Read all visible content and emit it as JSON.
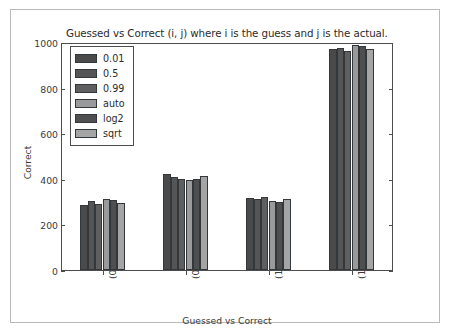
{
  "chart_data": {
    "type": "bar",
    "title": "Guessed vs Correct (i, j) where i is the guess and j is the actual.",
    "xlabel": "Guessed vs Correct",
    "ylabel": "Correct",
    "categories": [
      "(0, 0)",
      "(0, 1)",
      "(1, 0)",
      "(1, 1)"
    ],
    "ylim": [
      0,
      1000
    ],
    "yticks": [
      0,
      200,
      400,
      600,
      800,
      1000
    ],
    "ytick_labels": [
      "0",
      "200",
      "400",
      "600",
      "800",
      "1000"
    ],
    "grid": false,
    "legend_position": "upper left",
    "series": [
      {
        "name": "0.01",
        "color": "#4a4a4a",
        "values": [
          286,
          420,
          316,
          968
        ]
      },
      {
        "name": "0.5",
        "color": "#555555",
        "values": [
          303,
          406,
          313,
          972
        ]
      },
      {
        "name": "0.99",
        "color": "#5f5f5f",
        "values": [
          290,
          400,
          322,
          962
        ]
      },
      {
        "name": "auto",
        "color": "#9a9a9a",
        "values": [
          311,
          394,
          304,
          988
        ]
      },
      {
        "name": "log2",
        "color": "#4f4f4f",
        "values": [
          305,
          401,
          299,
          984
        ]
      },
      {
        "name": "sqrt",
        "color": "#a5a5a5",
        "values": [
          296,
          412,
          311,
          971
        ]
      }
    ]
  }
}
